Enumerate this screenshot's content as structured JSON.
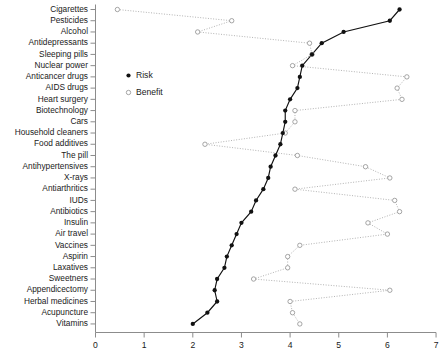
{
  "chart_data": {
    "type": "line",
    "title": "",
    "subtitle": "",
    "xlabel": "",
    "ylabel": "",
    "orientation": "horizontal",
    "xlim": [
      0,
      7
    ],
    "xticks": [
      0,
      1,
      2,
      3,
      4,
      5,
      6,
      7
    ],
    "xtick_labels": [
      "0",
      "1",
      "2",
      "3",
      "4",
      "5",
      "6",
      "7"
    ],
    "grid": false,
    "legend": {
      "position": "upper-left-inside",
      "entries": [
        {
          "name": "Risk",
          "marker": "filled-circle",
          "color": "#111111"
        },
        {
          "name": "Benefit",
          "marker": "open-circle",
          "color": "#8f8f8f"
        }
      ]
    },
    "categories": [
      "Cigarettes",
      "Pesticides",
      "Alcohol",
      "Antidepressants",
      "Sleeping pills",
      "Nuclear power",
      "Anticancer drugs",
      "AIDS drugs",
      "Heart surgery",
      "Biotechnology",
      "Cars",
      "Household cleaners",
      "Food additives",
      "The pill",
      "Antihypertensives",
      "X-rays",
      "Antiarthritics",
      "IUDs",
      "Antibiotics",
      "Insulin",
      "Air travel",
      "Vaccines",
      "Aspirin",
      "Laxatives",
      "Sweetners",
      "Appendicectomy",
      "Herbal medicines",
      "Acupuncture",
      "Vitamins"
    ],
    "series": [
      {
        "name": "Risk",
        "marker": "filled-circle",
        "color": "#111111",
        "values": [
          6.25,
          6.05,
          5.1,
          4.65,
          4.45,
          4.25,
          4.2,
          4.15,
          4.0,
          3.9,
          3.9,
          3.85,
          3.8,
          3.7,
          3.6,
          3.55,
          3.45,
          3.3,
          3.2,
          3.0,
          2.9,
          2.8,
          2.7,
          2.65,
          2.5,
          2.45,
          2.5,
          2.3,
          2.0
        ]
      },
      {
        "name": "Benefit",
        "marker": "open-circle",
        "color": "#8f8f8f",
        "values": [
          0.45,
          2.8,
          2.1,
          4.4,
          4.45,
          4.05,
          6.4,
          6.2,
          6.3,
          4.1,
          4.1,
          3.9,
          2.25,
          4.15,
          5.55,
          6.05,
          4.1,
          6.15,
          6.25,
          5.6,
          6.0,
          4.2,
          3.95,
          3.95,
          3.25,
          6.05,
          4.0,
          4.05,
          4.2
        ]
      }
    ]
  },
  "caption": "",
  "axis": {
    "x_start": 0,
    "x_end": 7
  }
}
